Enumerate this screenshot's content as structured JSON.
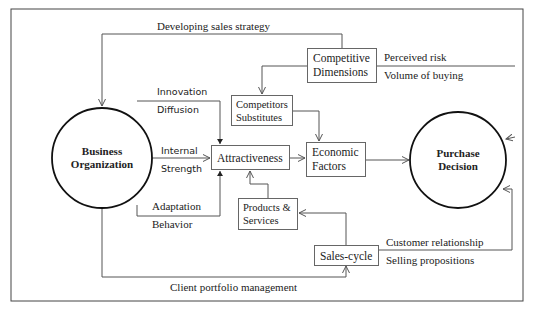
{
  "diagram": {
    "nodes": {
      "business_organization": {
        "line1": "Business",
        "line2": "Organization"
      },
      "purchase_decision": {
        "line1": "Purchase",
        "line2": "Decision"
      },
      "competitive_dimensions": {
        "line1": "Competitive",
        "line2": "Dimensions"
      },
      "competitors_substitutes": {
        "line1": "Competitors",
        "line2": "Substitutes"
      },
      "attractiveness": {
        "line1": "Attractiveness"
      },
      "economic_factors": {
        "line1": "Economic",
        "line2": "Factors"
      },
      "products_services": {
        "line1": "Products &",
        "line2": "Services"
      },
      "sales_cycle": {
        "line1": "Sales-cycle"
      }
    },
    "edge_labels": {
      "developing_sales_strategy": "Developing sales strategy",
      "perceived_risk": "Perceived risk",
      "volume_of_buying": "Volume of buying",
      "innovation": "Innovation",
      "diffusion": "Diffusion",
      "internal": "Internal",
      "strength": "Strength",
      "adaptation": "Adaptation",
      "behavior": "Behavior",
      "customer_relationship": "Customer relationship",
      "selling_propositions": "Selling propositions",
      "client_portfolio_management": "Client portfolio management"
    },
    "colors": {
      "line": "#555555",
      "circle": "#111111",
      "text": "#222222"
    }
  }
}
